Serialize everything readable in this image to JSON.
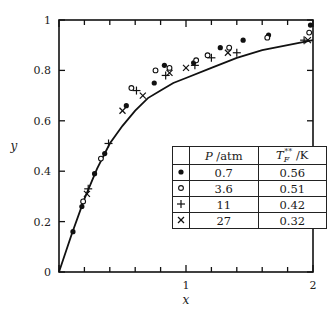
{
  "chart_data": {
    "type": "scatter",
    "title": "",
    "xlabel": "x",
    "ylabel": "y",
    "xlim": [
      0,
      2
    ],
    "ylim": [
      0,
      1
    ],
    "grid": false,
    "legend_position": "lower right (inside plot, as table)",
    "x_ticks": {
      "major": [
        0,
        1,
        2
      ],
      "minor_step": 0.2,
      "labels": [
        "",
        "1",
        "2"
      ]
    },
    "y_ticks": {
      "major": [
        0,
        0.2,
        0.4,
        0.6,
        0.8,
        1
      ],
      "labels": [
        "0",
        "0.2",
        "0.4",
        "0.6",
        "0.8",
        "1"
      ]
    },
    "legend_table": {
      "headers": [
        "",
        "P /atm",
        "T_F** /K"
      ],
      "rows": [
        {
          "symbol": "filled-circle",
          "P_atm": "0.7",
          "T_F_K": "0.56"
        },
        {
          "symbol": "open-circle",
          "P_atm": "3.6",
          "T_F_K": "0.51"
        },
        {
          "symbol": "plus",
          "P_atm": "11",
          "T_F_K": "0.42"
        },
        {
          "symbol": "cross",
          "P_atm": "27",
          "T_F_K": "0.32"
        }
      ]
    },
    "curve": {
      "name": "theory",
      "x": [
        0,
        0.1,
        0.2,
        0.3,
        0.4,
        0.5,
        0.6,
        0.7,
        0.8,
        0.9,
        1.0,
        1.2,
        1.4,
        1.6,
        1.8,
        2.0
      ],
      "y": [
        0,
        0.15,
        0.29,
        0.41,
        0.51,
        0.58,
        0.64,
        0.69,
        0.72,
        0.75,
        0.77,
        0.81,
        0.85,
        0.88,
        0.9,
        0.92
      ]
    },
    "series": [
      {
        "name": "0.7 atm",
        "marker": "filled-circle",
        "x": [
          0.11,
          0.18,
          0.28,
          0.36,
          0.53,
          0.75,
          0.83,
          1.06,
          1.27,
          1.45,
          1.65,
          1.98
        ],
        "y": [
          0.16,
          0.26,
          0.39,
          0.47,
          0.66,
          0.75,
          0.82,
          0.83,
          0.89,
          0.92,
          0.94,
          0.98
        ]
      },
      {
        "name": "3.6 atm",
        "marker": "open-circle",
        "x": [
          0.19,
          0.33,
          0.57,
          0.76,
          0.87,
          1.08,
          1.17,
          1.34,
          1.64,
          1.97
        ],
        "y": [
          0.28,
          0.45,
          0.73,
          0.8,
          0.81,
          0.84,
          0.86,
          0.89,
          0.93,
          0.95
        ]
      },
      {
        "name": "11 atm",
        "marker": "plus",
        "x": [
          0.23,
          0.39,
          0.61,
          0.84,
          1.07,
          1.2,
          1.4,
          1.93
        ],
        "y": [
          0.33,
          0.51,
          0.72,
          0.78,
          0.82,
          0.85,
          0.87,
          0.92
        ]
      },
      {
        "name": "27 atm",
        "marker": "cross",
        "x": [
          0.22,
          0.5,
          0.66,
          0.87,
          1.0,
          1.33,
          1.96
        ],
        "y": [
          0.31,
          0.64,
          0.7,
          0.79,
          0.81,
          0.87,
          0.92
        ]
      }
    ]
  },
  "labels": {
    "x_axis": "x",
    "y_axis": "y",
    "legend_h1": "P",
    "legend_h1_unit": " /atm",
    "legend_h2": "T",
    "legend_h2_sub": "F",
    "legend_h2_sup": "**",
    "legend_h2_unit": " /K"
  }
}
